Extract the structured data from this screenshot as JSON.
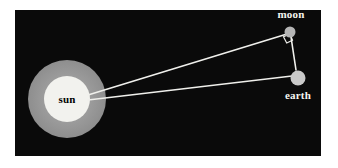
{
  "figure": {
    "canvas": {
      "width": 338,
      "height": 168,
      "background": "#ffffff"
    },
    "panel": {
      "name": "black-sky-panel",
      "x": 15,
      "y": 10,
      "width": 306,
      "height": 146,
      "fill": "#0a0a0a"
    }
  },
  "colors": {
    "background": "#ffffff",
    "panel": "#0a0a0a",
    "sun_halo": "#9a9a9a",
    "sun_core": "#f2f2ee",
    "moon": "#b5b5b5",
    "earth": "#c9c9c9",
    "line": "#f0f0ec",
    "label_light": "#f5f5f0",
    "label_dark": "#000000"
  },
  "bodies": {
    "sun": {
      "label": "sun",
      "cx": 67,
      "cy": 99,
      "halo_r": 39,
      "core_r": 23,
      "label_x": 67,
      "label_y": 101,
      "label_color": "#000000"
    },
    "moon": {
      "label": "moon",
      "cx": 290,
      "cy": 32,
      "r": 5.5,
      "label_x": 291,
      "label_y": 18,
      "label_color": "#f5f5f0"
    },
    "earth": {
      "label": "earth",
      "cx": 298,
      "cy": 78,
      "r": 7.5,
      "label_x": 298,
      "label_y": 99,
      "label_color": "#f5f5f0"
    }
  },
  "lines": [
    {
      "name": "sun-to-moon-line",
      "x1": 88,
      "y1": 95,
      "x2": 287,
      "y2": 34,
      "width": 1.6
    },
    {
      "name": "sun-to-earth-line",
      "x1": 88,
      "y1": 100,
      "x2": 292,
      "y2": 76,
      "width": 1.6
    },
    {
      "name": "moon-to-earth-line",
      "x1": 291,
      "y1": 37,
      "x2": 296,
      "y2": 70,
      "width": 1.6
    }
  ],
  "right_angle_marker": {
    "name": "right-angle-square",
    "vertex_x": 290,
    "vertex_y": 32,
    "size": 8,
    "stroke": "#f0f0ec",
    "stroke_width": 1.2,
    "points": "283.5,36.7 286.7,43.0 292.5,40.2 290.0,34.0"
  },
  "labels": {
    "sun": "sun",
    "moon": "moon",
    "earth": "earth"
  }
}
